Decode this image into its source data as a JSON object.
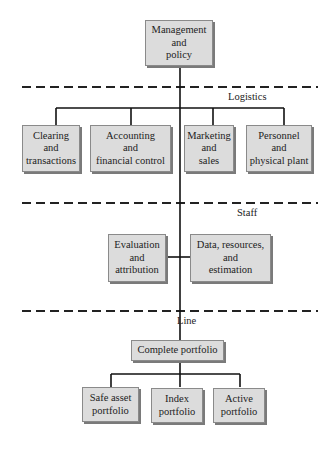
{
  "diagram": {
    "top": {
      "label": "Management\nand\npolicy"
    },
    "tiers": [
      {
        "label": "Logistics"
      },
      {
        "label": "Staff"
      },
      {
        "label": "Line"
      }
    ],
    "logistics": [
      {
        "label": "Clearing\nand\ntransactions"
      },
      {
        "label": "Accounting\nand\nfinancial control"
      },
      {
        "label": "Marketing\nand\nsales"
      },
      {
        "label": "Personnel\nand\nphysical plant"
      }
    ],
    "staff": [
      {
        "label": "Evaluation\nand\nattribution"
      },
      {
        "label": "Data, resources,\nand\nestimation"
      }
    ],
    "line": {
      "root": {
        "label": "Complete portfolio"
      },
      "children": [
        {
          "label": "Safe asset\nportfolio"
        },
        {
          "label": "Index\nportfolio"
        },
        {
          "label": "Active\nportfolio"
        }
      ]
    },
    "colors": {
      "box_fill": "#dcdcdc",
      "line": "#1a1a1a",
      "shadow": "#7a7a7a"
    }
  }
}
